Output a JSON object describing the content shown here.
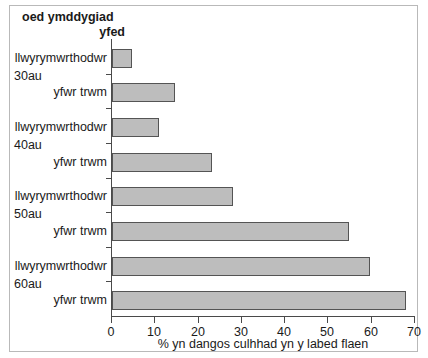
{
  "header": {
    "line1": "oed   ymddygiad",
    "line2": "yfed"
  },
  "chart_data": {
    "type": "bar",
    "orientation": "horizontal",
    "title": "",
    "header_columns": [
      "oed",
      "ymddygiad yfed"
    ],
    "xlabel": "% yn dangos culhhad yn y labed flaen",
    "ylabel": "",
    "xlim": [
      0,
      70
    ],
    "xticks": [
      0,
      10,
      20,
      30,
      40,
      50,
      60,
      70
    ],
    "xtick_labels": [
      "0",
      "10",
      "20",
      "30",
      "40",
      "50",
      "60",
      "70"
    ],
    "grid": false,
    "legend": "none",
    "bar_fill_color": "#bdbdbd",
    "bar_edge_color": "#545454",
    "groups": [
      {
        "age": "30au",
        "bars": [
          {
            "label": "llwyrymwrthodwr",
            "value": 4.6
          },
          {
            "label": "yfwr trwm",
            "value": 14.5
          }
        ]
      },
      {
        "age": "40au",
        "bars": [
          {
            "label": "llwyrymwrthodwr",
            "value": 10.8
          },
          {
            "label": "yfwr trwm",
            "value": 23.0
          }
        ]
      },
      {
        "age": "50au",
        "bars": [
          {
            "label": "llwyrymwrthodwr",
            "value": 28.0
          },
          {
            "label": "yfwr trwm",
            "value": 54.7
          }
        ]
      },
      {
        "age": "60au",
        "bars": [
          {
            "label": "llwyrymwrthodwr",
            "value": 59.6
          },
          {
            "label": "yfwr trwm",
            "value": 68.0
          }
        ]
      }
    ]
  }
}
